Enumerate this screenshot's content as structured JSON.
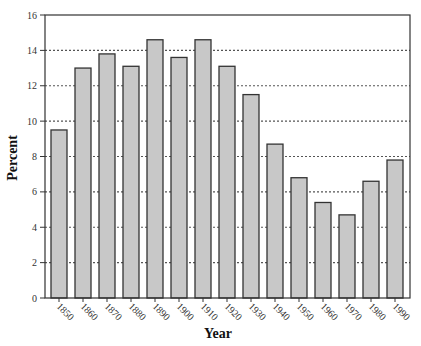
{
  "chart_data": {
    "type": "bar",
    "title": "",
    "xlabel": "Year",
    "ylabel": "Percent",
    "categories": [
      "1850",
      "1860",
      "1870",
      "1880",
      "1890",
      "1900",
      "1910",
      "1920",
      "1930",
      "1940",
      "1950",
      "1960",
      "1970",
      "1980",
      "1990"
    ],
    "values": [
      9.5,
      13.0,
      13.8,
      13.1,
      14.6,
      13.6,
      14.6,
      13.1,
      11.5,
      8.7,
      6.8,
      5.4,
      4.7,
      6.6,
      7.8
    ],
    "ylim": [
      0,
      16
    ],
    "yticks": [
      0,
      2,
      4,
      6,
      8,
      10,
      12,
      14,
      16
    ],
    "grid": {
      "y": true,
      "style": "dotted"
    },
    "legend": null,
    "colors": {
      "bar_fill": "#c8c8c8",
      "bar_stroke": "#333333",
      "grid": "#555555",
      "axis": "#333333"
    }
  }
}
